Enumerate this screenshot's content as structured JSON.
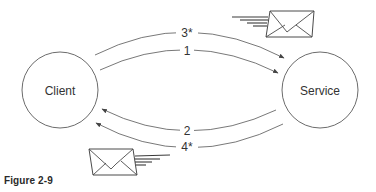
{
  "nodes": {
    "client": {
      "label": "Client"
    },
    "service": {
      "label": "Service"
    }
  },
  "arrows": [
    {
      "id": "arrow-3",
      "label": "3*",
      "from": "Client",
      "to": "Service",
      "async": true
    },
    {
      "id": "arrow-1",
      "label": "1",
      "from": "Client",
      "to": "Service",
      "async": false
    },
    {
      "id": "arrow-2",
      "label": "2",
      "from": "Service",
      "to": "Client",
      "async": false
    },
    {
      "id": "arrow-4",
      "label": "4*",
      "from": "Service",
      "to": "Client",
      "async": true
    }
  ],
  "icons": {
    "top_envelope": "envelope-icon",
    "bottom_envelope": "envelope-icon"
  },
  "caption": "Figure 2-9",
  "colors": {
    "stroke": "#555555",
    "text": "#333333",
    "background": "#ffffff"
  }
}
